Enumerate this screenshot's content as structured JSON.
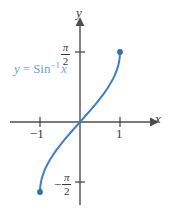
{
  "figure": {
    "background_color": "#ffffff",
    "curve_color": "#3d7fc1",
    "axis_color": "#4d4d4d",
    "label_color": "#6ca4d4",
    "tick_text_color": "#3a3a3a"
  },
  "axes": {
    "x_name": "x",
    "y_name": "y"
  },
  "ticks": {
    "x": [
      {
        "label": "−1",
        "value": -1
      },
      {
        "label": "1",
        "value": 1
      }
    ],
    "y": [
      {
        "sign": "",
        "numerator": "π",
        "denominator": "2",
        "value": 1.5708
      },
      {
        "sign": "−",
        "numerator": "π",
        "denominator": "2",
        "value": -1.5708
      }
    ]
  },
  "annotation": {
    "y_var": "y",
    "equals": "=",
    "function_name": "Sin",
    "exponent": "−1",
    "argument": "x"
  },
  "chart_data": {
    "type": "line",
    "title": "",
    "subtitle": "",
    "xlabel": "x",
    "ylabel": "y",
    "xlim": [
      -1.45,
      1.45
    ],
    "ylim": [
      -2.1,
      2.1
    ],
    "grid": false,
    "legend": null,
    "annotations": [
      {
        "text": "y = Sin−1 x",
        "x": -0.9,
        "y": 1.1
      }
    ],
    "xticks": [
      -1,
      1
    ],
    "xticklabels": [
      "−1",
      "1"
    ],
    "yticks": [
      -1.5708,
      1.5708
    ],
    "yticklabels": [
      "−π/2",
      "π/2"
    ],
    "series": [
      {
        "name": "y = Sin^-1 x",
        "color": "#3d7fc1",
        "x": [
          -1,
          -0.99,
          -0.96,
          -0.92,
          -0.86,
          -0.78,
          -0.7,
          -0.6,
          -0.5,
          -0.4,
          -0.3,
          -0.2,
          -0.1,
          0,
          0.1,
          0.2,
          0.3,
          0.4,
          0.5,
          0.6,
          0.7,
          0.78,
          0.86,
          0.92,
          0.96,
          0.99,
          1
        ],
        "y": [
          -1.5708,
          -1.4288,
          -1.287,
          -1.1684,
          -1.0297,
          -0.8946,
          -0.7754,
          -0.6435,
          -0.5236,
          -0.4115,
          -0.3047,
          -0.2014,
          -0.1002,
          0,
          0.1002,
          0.2014,
          0.3047,
          0.4115,
          0.5236,
          0.6435,
          0.7754,
          0.8946,
          1.0297,
          1.1684,
          1.287,
          1.4288,
          1.5708
        ]
      }
    ],
    "endpoints": [
      {
        "x": -1,
        "y": -1.5708,
        "style": "filled"
      },
      {
        "x": 1,
        "y": 1.5708,
        "style": "filled"
      }
    ]
  }
}
